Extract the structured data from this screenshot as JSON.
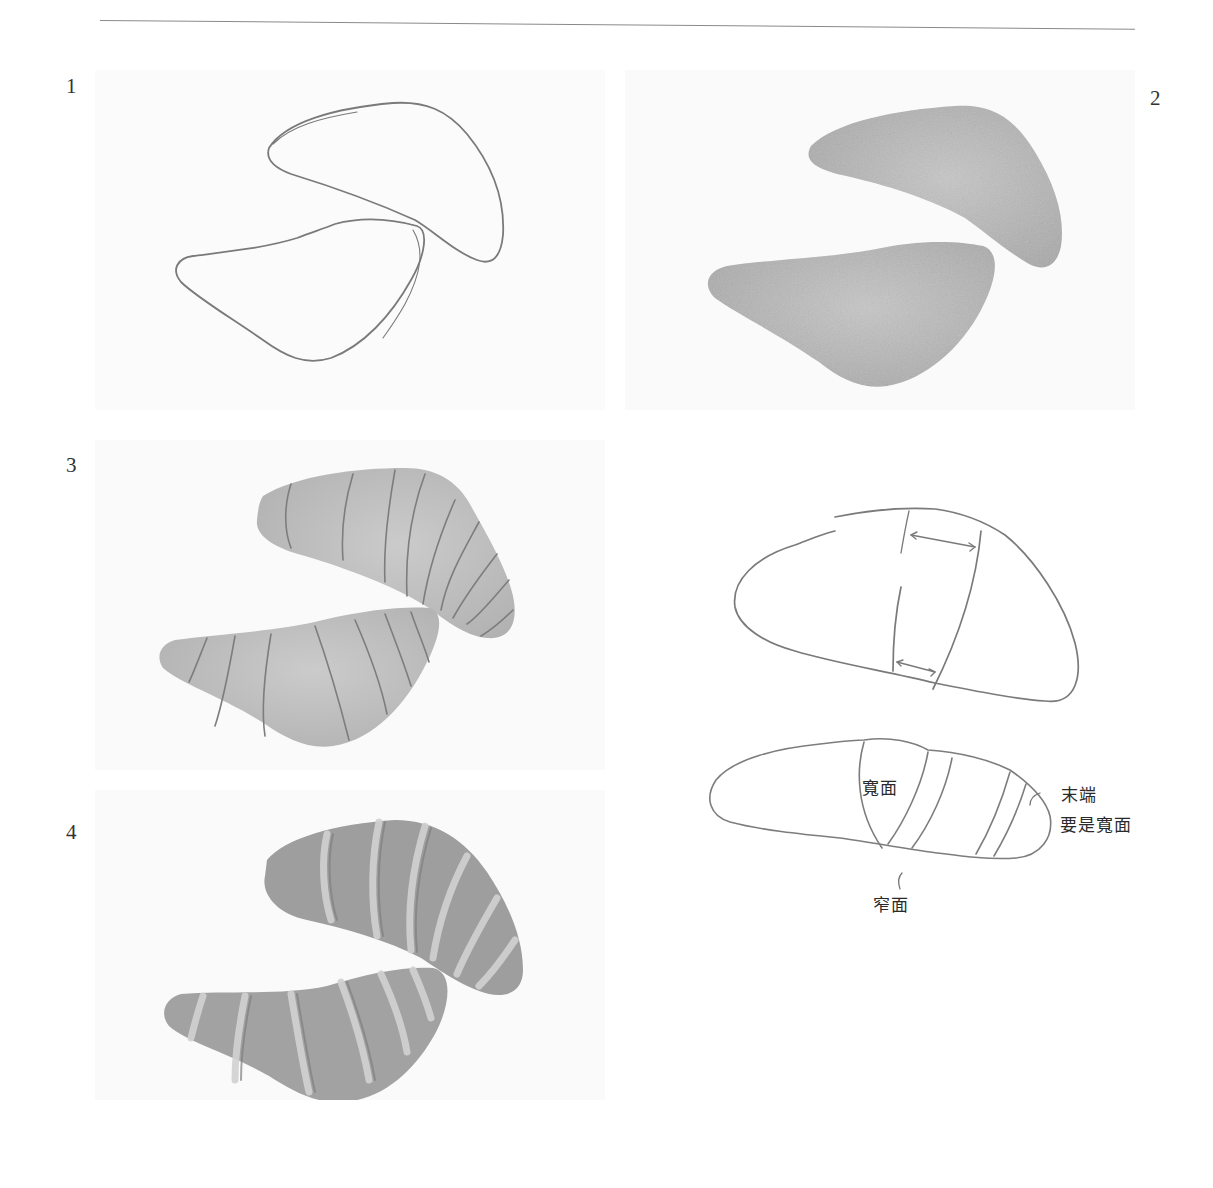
{
  "page": {
    "top_rule": true,
    "paper_color": "#ffffff",
    "ink_color": "#6e6e6e",
    "shading_light": "#c9c9c9",
    "shading_dark": "#9a9a9a"
  },
  "steps": [
    {
      "number": "1",
      "description": "Outline sketch of two croissant shapes"
    },
    {
      "number": "2",
      "description": "Shapes filled with even base shading"
    },
    {
      "number": "3",
      "description": "Curved segment lines drawn across shaded shapes"
    },
    {
      "number": "4",
      "description": "Finished rendered croissants with layered segments"
    }
  ],
  "diagram": {
    "labels": {
      "wide_face": "寬面",
      "narrow_face": "窄面",
      "tip": "末端",
      "tip_note": "要是寬面"
    }
  }
}
